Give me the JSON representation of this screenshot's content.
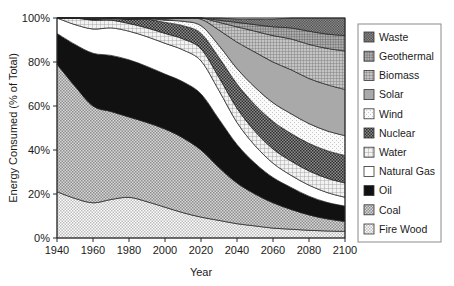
{
  "chart_data": {
    "type": "area",
    "stacked": true,
    "title": "",
    "xlabel": "Year",
    "ylabel": "Energy Consumed (% of Total)",
    "xlim": [
      1940,
      2100
    ],
    "ylim": [
      0,
      100
    ],
    "grid": false,
    "legend_position": "right",
    "xticks": [
      1940,
      1960,
      1980,
      2000,
      2020,
      2040,
      2060,
      2080,
      2100
    ],
    "xtick_labels": [
      "1940",
      "1960",
      "1980",
      "2000",
      "2020",
      "2040",
      "2060",
      "2080",
      "2100"
    ],
    "yticks": [
      0,
      20,
      40,
      60,
      80,
      100
    ],
    "ytick_labels": [
      "0%",
      "20%",
      "40%",
      "60%",
      "80%",
      "100%"
    ],
    "x": [
      1940,
      1950,
      1960,
      1970,
      1980,
      1990,
      2000,
      2010,
      2020,
      2030,
      2040,
      2050,
      2060,
      2070,
      2080,
      2090,
      2100
    ],
    "stack_order_bottom_to_top": [
      "Fire Wood",
      "Coal",
      "Oil",
      "Natural Gas",
      "Water",
      "Nuclear",
      "Wind",
      "Solar",
      "Biomass",
      "Geothermal",
      "Waste"
    ],
    "series": [
      {
        "name": "Fire Wood",
        "pattern": "checker-light",
        "color": "#e2e2e2",
        "values": [
          21.0,
          18.0,
          16.0,
          17.5,
          18.5,
          16.5,
          14.0,
          11.5,
          9.5,
          8.0,
          6.5,
          5.5,
          4.5,
          4.0,
          3.5,
          3.2,
          3.0
        ]
      },
      {
        "name": "Coal",
        "pattern": "checker-medium",
        "color": "#b4b4b4",
        "values": [
          58.0,
          51.0,
          44.0,
          40.0,
          36.5,
          36.0,
          35.5,
          34.0,
          30.5,
          24.0,
          18.5,
          14.5,
          11.5,
          9.0,
          7.0,
          5.5,
          4.5
        ]
      },
      {
        "name": "Oil",
        "pattern": "solid",
        "color": "#121212",
        "values": [
          14.0,
          19.0,
          24.0,
          25.5,
          26.0,
          25.5,
          25.0,
          25.5,
          25.5,
          22.0,
          17.5,
          14.0,
          11.5,
          10.0,
          8.5,
          7.5,
          7.0
        ]
      },
      {
        "name": "Natural Gas",
        "pattern": "blank",
        "color": "#ffffff",
        "values": [
          7.0,
          9.0,
          11.0,
          12.5,
          13.0,
          13.5,
          14.0,
          14.5,
          15.0,
          13.0,
          10.0,
          8.0,
          6.5,
          5.5,
          5.0,
          4.5,
          4.0
        ]
      },
      {
        "name": "Water",
        "pattern": "grid-light",
        "color": "#d2d2d2",
        "values": [
          0.0,
          3.0,
          4.0,
          3.5,
          3.5,
          4.0,
          4.5,
          5.0,
          5.5,
          6.0,
          6.5,
          6.5,
          6.5,
          6.5,
          6.5,
          6.5,
          6.5
        ]
      },
      {
        "name": "Nuclear",
        "pattern": "checker-dark",
        "color": "#585858",
        "values": [
          0.0,
          0.0,
          0.5,
          1.0,
          2.0,
          4.0,
          5.0,
          6.0,
          7.0,
          9.0,
          11.0,
          12.0,
          12.5,
          12.5,
          12.5,
          12.5,
          12.5
        ]
      },
      {
        "name": "Wind",
        "pattern": "dots-sparse",
        "color": "#ededed",
        "values": [
          0.0,
          0.0,
          0.0,
          0.0,
          0.0,
          0.3,
          1.0,
          2.0,
          3.5,
          5.5,
          7.0,
          8.0,
          8.5,
          9.0,
          9.0,
          9.0,
          9.0
        ]
      },
      {
        "name": "Solar",
        "pattern": "solid-grey",
        "color": "#a8a8a8",
        "values": [
          0.0,
          0.0,
          0.0,
          0.0,
          0.0,
          0.2,
          0.5,
          1.5,
          3.0,
          7.0,
          12.0,
          16.0,
          18.5,
          20.0,
          20.5,
          21.0,
          21.0
        ]
      },
      {
        "name": "Biomass",
        "pattern": "grid-medium",
        "color": "#bdbdbd",
        "values": [
          0.0,
          0.0,
          0.5,
          0.0,
          0.5,
          0.0,
          0.5,
          0.0,
          0.5,
          3.5,
          7.0,
          9.5,
          12.0,
          14.0,
          15.5,
          16.5,
          17.5
        ]
      },
      {
        "name": "Geothermal",
        "pattern": "grid-fine",
        "color": "#9e9e9e",
        "values": [
          0.0,
          0.0,
          0.0,
          0.0,
          0.0,
          0.0,
          0.0,
          0.0,
          0.0,
          1.0,
          2.0,
          3.0,
          4.0,
          5.0,
          6.0,
          6.5,
          7.0
        ]
      },
      {
        "name": "Waste",
        "pattern": "checker-dense",
        "color": "#6e6e6e",
        "values": [
          0.0,
          0.0,
          0.0,
          0.0,
          0.0,
          0.0,
          0.0,
          0.0,
          0.0,
          1.0,
          1.5,
          2.5,
          3.5,
          4.5,
          6.0,
          7.3,
          8.0
        ]
      }
    ]
  },
  "legend": {
    "items": [
      {
        "label": "Waste",
        "swatch": "waste-swatch"
      },
      {
        "label": "Geothermal",
        "swatch": "geothermal-swatch"
      },
      {
        "label": "Biomass",
        "swatch": "biomass-swatch"
      },
      {
        "label": "Solar",
        "swatch": "solar-swatch"
      },
      {
        "label": "Wind",
        "swatch": "wind-swatch"
      },
      {
        "label": "Nuclear",
        "swatch": "nuclear-swatch"
      },
      {
        "label": "Water",
        "swatch": "water-swatch"
      },
      {
        "label": "Natural Gas",
        "swatch": "natural-gas-swatch"
      },
      {
        "label": "Oil",
        "swatch": "oil-swatch"
      },
      {
        "label": "Coal",
        "swatch": "coal-swatch"
      },
      {
        "label": "Fire Wood",
        "swatch": "fire-wood-swatch"
      }
    ]
  }
}
